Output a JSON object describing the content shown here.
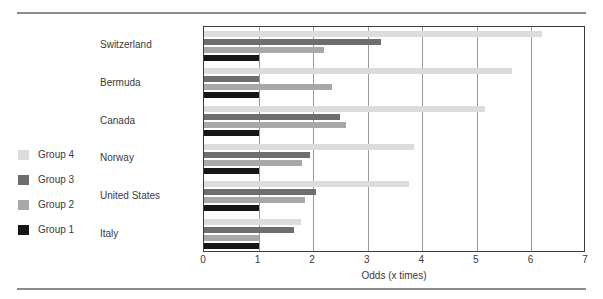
{
  "figure": {
    "cropped_caption_sliver": "",
    "axis_label": "Odds (x times)"
  },
  "legend": {
    "position": "left",
    "items": [
      {
        "label": "Group 4",
        "color": "#dcdcdc"
      },
      {
        "label": "Group 3",
        "color": "#6e6e6e"
      },
      {
        "label": "Group 2",
        "color": "#a8a8a8"
      },
      {
        "label": "Group 1",
        "color": "#161616"
      }
    ]
  },
  "chart_data": {
    "type": "bar",
    "orientation": "horizontal",
    "title": "",
    "subtitle": "",
    "xlabel": "Odds (x times)",
    "ylabel": "",
    "xlim": [
      0,
      7
    ],
    "xticks": [
      0,
      1,
      2,
      3,
      4,
      5,
      6,
      7
    ],
    "xtick_labels": [
      "0",
      "1",
      "2",
      "3",
      "4",
      "5",
      "6",
      "7"
    ],
    "grid": true,
    "grid_axis": "x",
    "legend_position": "left",
    "categories": [
      "Switzerland",
      "Bermuda",
      "Canada",
      "Norway",
      "United States",
      "Italy"
    ],
    "series": [
      {
        "name": "Group 4",
        "color": "#dcdcdc",
        "values": [
          6.2,
          5.65,
          5.15,
          3.85,
          3.75,
          1.78
        ]
      },
      {
        "name": "Group 3",
        "color": "#6e6e6e",
        "values": [
          3.25,
          1.0,
          2.5,
          1.95,
          2.05,
          1.65
        ]
      },
      {
        "name": "Group 2",
        "color": "#a8a8a8",
        "values": [
          2.2,
          2.35,
          2.6,
          1.8,
          1.85,
          1.0
        ]
      },
      {
        "name": "Group 1",
        "color": "#161616",
        "values": [
          1.0,
          1.0,
          1.0,
          1.0,
          1.0,
          1.0
        ]
      }
    ]
  }
}
